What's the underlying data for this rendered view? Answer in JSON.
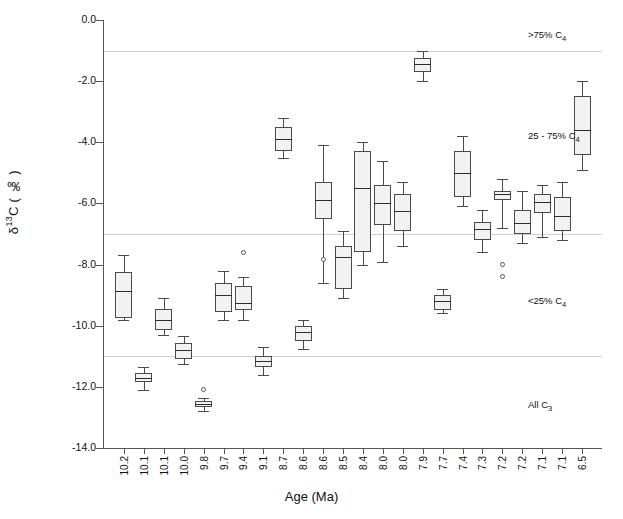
{
  "chart_data": {
    "type": "box",
    "title": "",
    "xlabel": "Age (Ma)",
    "ylabel": "δ13C ( ‰ )",
    "ylim": [
      -14.0,
      0.0
    ],
    "ytick_labels": [
      "0.0",
      "-2.0",
      "-4.0",
      "-6.0",
      "-8.0",
      "-10.0",
      "-12.0",
      "-14.0"
    ],
    "ytick_values": [
      0.0,
      -2.0,
      -4.0,
      -6.0,
      -8.0,
      -10.0,
      -12.0,
      -14.0
    ],
    "grid": "horizontal reference lines only",
    "gridline_values": [
      -1.0,
      -7.0,
      -11.0
    ],
    "legend_position": "right-inside",
    "categories": [
      "10.2",
      "10.1",
      "10.1",
      "10.0",
      "9.8",
      "9.7",
      "9.4",
      "9.1",
      "8.7",
      "8.6",
      "8.6",
      "8.5",
      "8.4",
      "8.0",
      "8.0",
      "7.9",
      "7.7",
      "7.4",
      "7.3",
      "7.2",
      "7.2",
      "7.1",
      "7.1",
      "6.5"
    ],
    "zone_annotations": [
      {
        "label": ">75% C",
        "sub": "4",
        "value": -0.5
      },
      {
        "label": "25 - 75% C",
        "sub": "4",
        "value": -3.8
      },
      {
        "label": "<25% C",
        "sub": "4",
        "value": -9.2
      },
      {
        "label": "All C",
        "sub": "3",
        "value": -12.6
      }
    ],
    "boxes": [
      {
        "x": "10.2",
        "whisker_high": -7.7,
        "q3": -8.25,
        "median": -8.85,
        "q1": -9.75,
        "whisker_low": -9.8,
        "outliers": []
      },
      {
        "x": "10.1",
        "whisker_high": -11.35,
        "q3": -11.55,
        "median": -11.7,
        "q1": -11.85,
        "whisker_low": -12.1,
        "outliers": []
      },
      {
        "x": "10.1",
        "whisker_high": -9.1,
        "q3": -9.45,
        "median": -9.8,
        "q1": -10.15,
        "whisker_low": -10.3,
        "outliers": []
      },
      {
        "x": "10.0",
        "whisker_high": -10.35,
        "q3": -10.55,
        "median": -10.8,
        "q1": -11.1,
        "whisker_low": -11.25,
        "outliers": []
      },
      {
        "x": "9.8",
        "whisker_high": -12.35,
        "q3": -12.45,
        "median": -12.55,
        "q1": -12.65,
        "whisker_low": -12.8,
        "outliers": [
          -12.1
        ]
      },
      {
        "x": "9.7",
        "whisker_high": -8.2,
        "q3": -8.6,
        "median": -9.0,
        "q1": -9.55,
        "whisker_low": -9.8,
        "outliers": []
      },
      {
        "x": "9.4",
        "whisker_high": -8.4,
        "q3": -8.7,
        "median": -9.25,
        "q1": -9.5,
        "whisker_low": -9.8,
        "outliers": [
          -7.6
        ]
      },
      {
        "x": "9.1",
        "whisker_high": -10.7,
        "q3": -11.0,
        "median": -11.15,
        "q1": -11.35,
        "whisker_low": -11.6,
        "outliers": []
      },
      {
        "x": "8.7",
        "whisker_high": -3.2,
        "q3": -3.5,
        "median": -3.9,
        "q1": -4.3,
        "whisker_low": -4.5,
        "outliers": []
      },
      {
        "x": "8.6",
        "whisker_high": -9.8,
        "q3": -10.0,
        "median": -10.2,
        "q1": -10.5,
        "whisker_low": -10.75,
        "outliers": []
      },
      {
        "x": "8.6",
        "whisker_high": -4.1,
        "q3": -5.3,
        "median": -5.9,
        "q1": -6.5,
        "whisker_low": -8.6,
        "outliers": [
          -7.85
        ]
      },
      {
        "x": "8.5",
        "whisker_high": -6.9,
        "q3": -7.4,
        "median": -7.75,
        "q1": -8.8,
        "whisker_low": -9.1,
        "outliers": []
      },
      {
        "x": "8.4",
        "whisker_high": -4.0,
        "q3": -4.3,
        "median": -5.5,
        "q1": -7.6,
        "whisker_low": -8.0,
        "outliers": []
      },
      {
        "x": "8.0",
        "whisker_high": -4.6,
        "q3": -5.4,
        "median": -6.0,
        "q1": -6.7,
        "whisker_low": -7.9,
        "outliers": []
      },
      {
        "x": "8.0",
        "whisker_high": -5.3,
        "q3": -5.7,
        "median": -6.25,
        "q1": -6.9,
        "whisker_low": -7.4,
        "outliers": []
      },
      {
        "x": "7.9",
        "whisker_high": -1.0,
        "q3": -1.25,
        "median": -1.45,
        "q1": -1.7,
        "whisker_low": -2.0,
        "outliers": []
      },
      {
        "x": "7.7",
        "whisker_high": -8.8,
        "q3": -9.0,
        "median": -9.2,
        "q1": -9.5,
        "whisker_low": -9.6,
        "outliers": []
      },
      {
        "x": "7.4",
        "whisker_high": -3.8,
        "q3": -4.3,
        "median": -5.0,
        "q1": -5.8,
        "whisker_low": -6.1,
        "outliers": []
      },
      {
        "x": "7.3",
        "whisker_high": -6.2,
        "q3": -6.6,
        "median": -6.85,
        "q1": -7.2,
        "whisker_low": -7.6,
        "outliers": []
      },
      {
        "x": "7.2",
        "whisker_high": -5.2,
        "q3": -5.6,
        "median": -5.7,
        "q1": -5.9,
        "whisker_low": -6.8,
        "outliers": [
          -8.0,
          -8.4
        ]
      },
      {
        "x": "7.2",
        "whisker_high": -5.6,
        "q3": -6.2,
        "median": -6.65,
        "q1": -7.0,
        "whisker_low": -7.3,
        "outliers": []
      },
      {
        "x": "7.1",
        "whisker_high": -5.4,
        "q3": -5.7,
        "median": -5.95,
        "q1": -6.3,
        "whisker_low": -7.1,
        "outliers": []
      },
      {
        "x": "7.1",
        "whisker_high": -5.3,
        "q3": -5.8,
        "median": -6.4,
        "q1": -6.9,
        "whisker_low": -7.2,
        "outliers": []
      },
      {
        "x": "6.5",
        "whisker_high": -2.0,
        "q3": -2.5,
        "median": -3.6,
        "q1": -4.4,
        "whisker_low": -4.9,
        "outliers": []
      }
    ]
  }
}
